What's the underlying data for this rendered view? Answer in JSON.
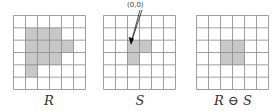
{
  "figure": {
    "grid_size": 6,
    "cell_color": "#c8c8c8",
    "line_color": "#888888",
    "panels": [
      {
        "id": "R",
        "label": "R",
        "shaded": [
          [
            1,
            1
          ],
          [
            1,
            2
          ],
          [
            1,
            3
          ],
          [
            2,
            1
          ],
          [
            2,
            2
          ],
          [
            2,
            3
          ],
          [
            2,
            4
          ],
          [
            3,
            1
          ],
          [
            3,
            2
          ],
          [
            3,
            3
          ],
          [
            4,
            1
          ]
        ]
      },
      {
        "id": "S",
        "label": "S",
        "shaded": [
          [
            2,
            2
          ],
          [
            2,
            3
          ],
          [
            3,
            2
          ]
        ]
      },
      {
        "id": "erosion",
        "label": "R ⊖ S",
        "shaded": [
          [
            2,
            2
          ],
          [
            2,
            3
          ],
          [
            3,
            2
          ],
          [
            3,
            3
          ]
        ]
      }
    ],
    "origin_annotation": "(0,0)"
  }
}
